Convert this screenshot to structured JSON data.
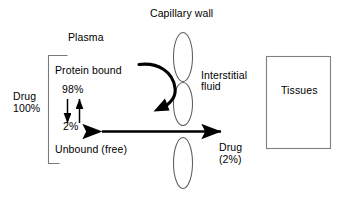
{
  "diagram": {
    "background_color": "#ffffff",
    "line_color": "#000000",
    "ellipse_stroke_color": "#595959",
    "box_stroke_color": "#808080",
    "arrow_color": "#000000",
    "labels": {
      "capillary_wall": "Capillary wall",
      "plasma": "Plasma",
      "protein_bound": "Protein bound",
      "percent_bound": "98%",
      "percent_unbound": "2%",
      "unbound_free": "Unbound (free)",
      "drug_total_name": "Drug",
      "drug_total_value": "100%",
      "interstitial_fluid_line1": "Interstitial",
      "interstitial_fluid_line2": "fluid",
      "drug_transferred_name": "Drug",
      "drug_transferred_value": "(2%)",
      "tissues": "Tissues"
    }
  }
}
